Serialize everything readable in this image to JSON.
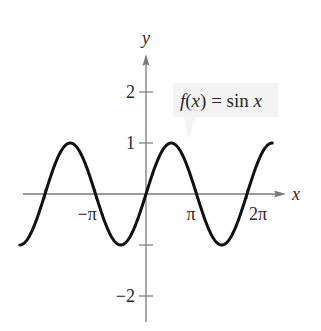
{
  "chart_data": {
    "type": "line",
    "title": "",
    "function": "sin",
    "annotation": {
      "text_fx": "f(x) = sin x",
      "parts": {
        "f": "f",
        "open": "(",
        "x": "x",
        "close": ")",
        "eq": " = sin ",
        "x2": "x"
      },
      "background": "#f2f2f2"
    },
    "xlabel": "x",
    "ylabel": "y",
    "xlim_pi": [
      -2.5,
      2.5
    ],
    "ylim": [
      -2.5,
      2.6
    ],
    "x_ticks": [
      {
        "value_pi": -2,
        "label": ""
      },
      {
        "value_pi": -1,
        "label": "−π"
      },
      {
        "value_pi": 1,
        "label": "π"
      },
      {
        "value_pi": 2,
        "label": "2π"
      }
    ],
    "y_ticks": [
      {
        "value": 2,
        "label": "2"
      },
      {
        "value": 1,
        "label": "1"
      },
      {
        "value": -1,
        "label": ""
      },
      {
        "value": -2,
        "label": "−2"
      }
    ],
    "grid": false,
    "legend": "none",
    "series": [
      {
        "name": "f(x) = sin x",
        "domain_pi": [
          -2.5,
          2.5
        ],
        "sample_points": [
          {
            "x": "-5π/2",
            "y": -1
          },
          {
            "x": "-2π",
            "y": 0
          },
          {
            "x": "-3π/2",
            "y": 1
          },
          {
            "x": "-π",
            "y": 0
          },
          {
            "x": "-π/2",
            "y": -1
          },
          {
            "x": "0",
            "y": 0
          },
          {
            "x": "π/2",
            "y": 1
          },
          {
            "x": "π",
            "y": 0
          },
          {
            "x": "3π/2",
            "y": -1
          },
          {
            "x": "2π",
            "y": 0
          },
          {
            "x": "5π/2",
            "y": 1
          }
        ],
        "color": "#111111"
      }
    ],
    "colors": {
      "axis": "#7a7a7a",
      "curve": "#111111",
      "text": "#2a2a2a"
    }
  }
}
